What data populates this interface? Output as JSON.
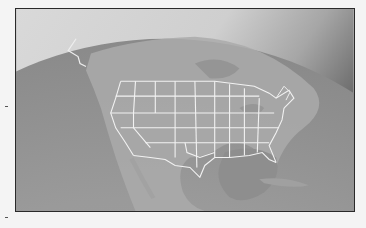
{
  "image": {
    "subject": "Globe view of North America with United States state borders",
    "style": "grayscale",
    "colors": {
      "space_light": "#e6e6e6",
      "space_dark": "#7a7a7a",
      "ocean": "#9c9c9c",
      "land": "#a9a9a9",
      "gulf": "#8f8f8f",
      "borders": "#f2f2f2",
      "frame": "#2a2a2a"
    }
  }
}
